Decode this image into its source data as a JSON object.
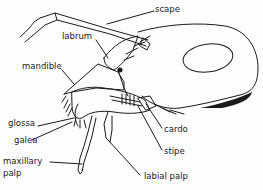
{
  "diagram": {
    "labels": {
      "scape": "scape",
      "labrum": "labrum",
      "mandible": "mandible",
      "glossa": "glossa",
      "galea": "galea",
      "maxillary_palp_line1": "maxillary",
      "maxillary_palp_line2": "palp",
      "cardo": "cardo",
      "stipe": "stipe",
      "labial_palp": "labial palp"
    },
    "colors": {
      "ink": "#1a1a1a",
      "background": "#fdfdfd"
    }
  }
}
